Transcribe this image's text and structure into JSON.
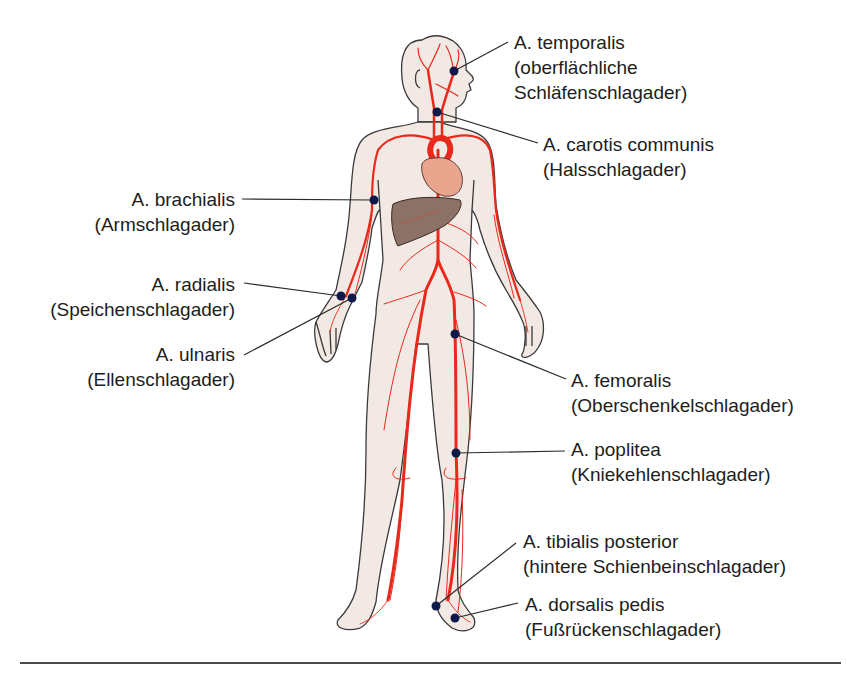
{
  "diagram": {
    "colors": {
      "skin_fill": "#f3e9e4",
      "outline": "#3a3a3a",
      "artery": "#e8291c",
      "heart": "#e9a58e",
      "liver": "#8c7266",
      "pulse_dot": "#0f1a4a",
      "leader_line": "#2a2a2a",
      "divider": "#4a4a4a"
    },
    "labels": [
      {
        "id": "temporalis",
        "latin": "A. temporalis",
        "german_line1": "(oberflächliche",
        "german_line2": "Schläfenschlagader)",
        "side": "right"
      },
      {
        "id": "carotis",
        "latin": "A. carotis communis",
        "german": "(Halsschlagader)",
        "side": "right"
      },
      {
        "id": "brachialis",
        "latin": "A. brachialis",
        "german": "(Armschlagader)",
        "side": "left"
      },
      {
        "id": "radialis",
        "latin": "A. radialis",
        "german": "(Speichenschlagader)",
        "side": "left"
      },
      {
        "id": "ulnaris",
        "latin": "A. ulnaris",
        "german": "(Ellenschlagader)",
        "side": "left"
      },
      {
        "id": "femoralis",
        "latin": "A. femoralis",
        "german": "(Oberschenkelschlagader)",
        "side": "right"
      },
      {
        "id": "poplitea",
        "latin": "A. poplitea",
        "german": "(Kniekehlenschlagader)",
        "side": "right"
      },
      {
        "id": "tibialis",
        "latin": "A. tibialis posterior",
        "german": "(hintere Schienbeinschlagader)",
        "side": "right"
      },
      {
        "id": "dorsalis",
        "latin": "A. dorsalis pedis",
        "german": "(Fußrückenschlagader)",
        "side": "right"
      }
    ],
    "pulse_points": [
      {
        "id": "temporalis",
        "x": 454,
        "y": 71
      },
      {
        "id": "carotis",
        "x": 437,
        "y": 112
      },
      {
        "id": "brachialis",
        "x": 374,
        "y": 200
      },
      {
        "id": "radialis",
        "x": 341,
        "y": 296
      },
      {
        "id": "ulnaris",
        "x": 352,
        "y": 298
      },
      {
        "id": "femoralis",
        "x": 455,
        "y": 334
      },
      {
        "id": "poplitea",
        "x": 456,
        "y": 453
      },
      {
        "id": "tibialis",
        "x": 436,
        "y": 606
      },
      {
        "id": "dorsalis",
        "x": 455,
        "y": 618
      }
    ]
  }
}
